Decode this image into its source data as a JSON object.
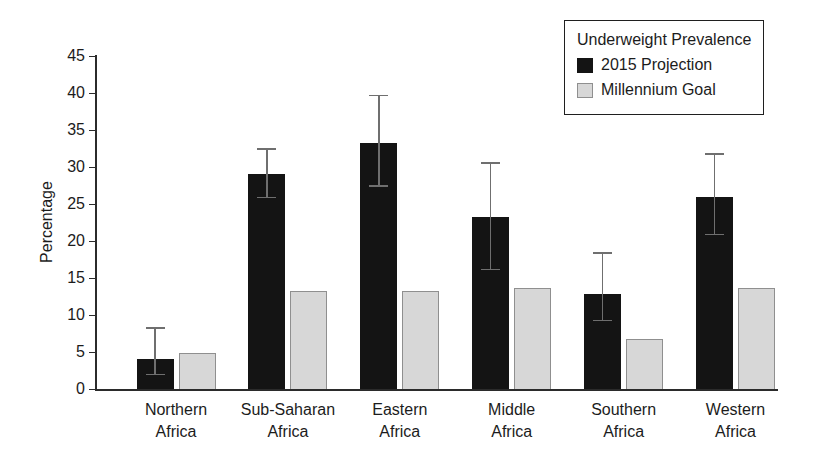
{
  "chart_data": {
    "type": "bar",
    "title": "",
    "xlabel": "",
    "ylabel": "Percentage",
    "ylim": [
      0,
      45
    ],
    "ytick_step": 5,
    "grid": false,
    "legend_position": "top-right",
    "legend_title": "Underweight Prevalence",
    "categories": [
      "Northern Africa",
      "Sub-Saharan Africa",
      "Eastern Africa",
      "Middle Africa",
      "Southern Africa",
      "Western Africa"
    ],
    "series": [
      {
        "name": "2015 Projection",
        "color": "#141414",
        "values": [
          4.1,
          29.0,
          33.2,
          23.3,
          12.8,
          26.0
        ],
        "error_low": [
          2.0,
          25.9,
          27.5,
          16.2,
          9.3,
          20.9
        ],
        "error_high": [
          8.3,
          32.5,
          39.7,
          30.6,
          18.4,
          31.8
        ]
      },
      {
        "name": "Millennium Goal",
        "color": "#d7d7d7",
        "border_color": "#8f8f8f",
        "values": [
          4.9,
          13.2,
          13.2,
          13.6,
          6.8,
          13.6
        ]
      }
    ],
    "error_bar_color": "#6f6f6f"
  },
  "colors": {
    "axis": "#2b2b2b",
    "text": "#1c1c1c",
    "background": "#ffffff"
  }
}
